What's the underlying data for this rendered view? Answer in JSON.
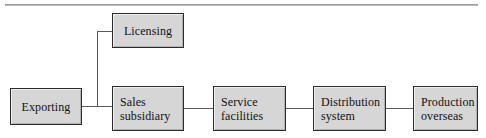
{
  "diagram": {
    "type": "flowchart",
    "orientation": "horizontal",
    "box_fill_color": "#d6d6d6",
    "box_border_color": "#2b2b2b",
    "connector_color": "#5a5a5a",
    "rule_color": "#8f8f8f",
    "nodes": [
      {
        "id": "exporting",
        "label": "Exporting",
        "lines": [
          "Exporting"
        ],
        "x": 10,
        "y": 88,
        "width": 72,
        "height": 37,
        "align": "center"
      },
      {
        "id": "licensing",
        "label": "Licensing",
        "lines": [
          "Licensing"
        ],
        "x": 112,
        "y": 13,
        "width": 72,
        "height": 35,
        "align": "center"
      },
      {
        "id": "sales-subsidiary",
        "label": "Sales subsidiary",
        "lines": [
          "Sales",
          "subsidiary"
        ],
        "x": 112,
        "y": 86,
        "width": 72,
        "height": 45,
        "align": "left"
      },
      {
        "id": "service-facilities",
        "label": "Service facilities",
        "lines": [
          "Service",
          "facilities"
        ],
        "x": 213,
        "y": 86,
        "width": 73,
        "height": 45,
        "align": "left"
      },
      {
        "id": "distribution-system",
        "label": "Distribution system",
        "lines": [
          "Distribution",
          "system"
        ],
        "x": 313,
        "y": 86,
        "width": 73,
        "height": 45,
        "align": "left"
      },
      {
        "id": "production-overseas",
        "label": "Production overseas",
        "lines": [
          "Production",
          "overseas"
        ],
        "x": 413,
        "y": 86,
        "width": 65,
        "height": 45,
        "align": "left"
      }
    ],
    "connectors": [
      {
        "id": "exporting-to-junction",
        "from": "exporting",
        "to": "junction",
        "orientation": "h",
        "x": 82,
        "y": 106,
        "length": 16
      },
      {
        "id": "junction-to-sales",
        "from": "junction",
        "to": "sales-subsidiary",
        "orientation": "h",
        "x": 98,
        "y": 106,
        "length": 14
      },
      {
        "id": "junction-riser",
        "from": "junction",
        "to": "licensing-stub",
        "orientation": "v",
        "x": 97,
        "y": 31,
        "length": 75
      },
      {
        "id": "licensing-stub",
        "from": "junction-riser",
        "to": "licensing",
        "orientation": "h",
        "x": 97,
        "y": 31,
        "length": 15
      },
      {
        "id": "sales-to-service",
        "from": "sales-subsidiary",
        "to": "service-facilities",
        "orientation": "h",
        "x": 184,
        "y": 108,
        "length": 29
      },
      {
        "id": "service-to-distribution",
        "from": "service-facilities",
        "to": "distribution-system",
        "orientation": "h",
        "x": 286,
        "y": 108,
        "length": 27
      },
      {
        "id": "distribution-to-production",
        "from": "distribution-system",
        "to": "production-overseas",
        "orientation": "h",
        "x": 386,
        "y": 108,
        "length": 27
      }
    ]
  }
}
